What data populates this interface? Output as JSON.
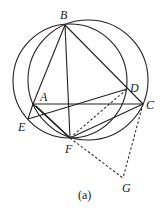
{
  "diagram": {
    "caption": "(a)",
    "points": {
      "A": {
        "label": "A",
        "x": 33,
        "y": 104
      },
      "B": {
        "label": "B",
        "x": 65,
        "y": 25
      },
      "C": {
        "label": "C",
        "x": 143,
        "y": 104
      },
      "D": {
        "label": "D",
        "x": 127,
        "y": 89
      },
      "E": {
        "label": "E",
        "x": 28,
        "y": 119
      },
      "F": {
        "label": "F",
        "x": 70,
        "y": 138
      },
      "G": {
        "label": "G",
        "x": 123,
        "y": 178
      }
    },
    "circles": [
      {
        "name": "circle-BEFD",
        "cx": 70,
        "cy": 81,
        "r": 57
      },
      {
        "name": "circle-BAFC",
        "cx": 88,
        "cy": 80,
        "r": 60
      }
    ],
    "segments_solid": [
      "BA",
      "BF",
      "BC",
      "AC",
      "AF",
      "EA",
      "ED",
      "EF",
      "FC"
    ],
    "segments_dashed": [
      "FD",
      "FG",
      "CG"
    ]
  }
}
